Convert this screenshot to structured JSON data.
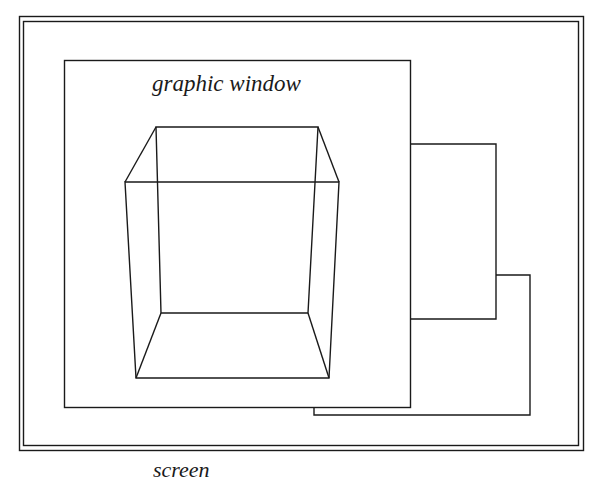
{
  "diagram": {
    "screen_label": "screen",
    "graphic_window_label": "graphic window",
    "stroke_color": "#1a1a1a",
    "background_color": "#ffffff"
  },
  "elements": {
    "screen": {
      "outer": [
        19,
        16,
        583,
        450
      ],
      "inner": [
        23,
        21,
        579,
        446
      ]
    },
    "graphic_window": [
      64,
      60,
      410,
      407
    ],
    "window_2": [
      410,
      144,
      496,
      319
    ],
    "window_3": [
      314,
      275,
      530,
      415
    ],
    "cube": {
      "back_top_left": [
        156,
        127
      ],
      "back_top_right": [
        318,
        127
      ],
      "front_top_left": [
        125,
        182
      ],
      "front_top_right": [
        339,
        182
      ],
      "back_bottom_left": [
        161,
        313
      ],
      "back_bottom_right": [
        308,
        313
      ],
      "front_bottom_left": [
        136,
        378
      ],
      "front_bottom_right": [
        329,
        378
      ]
    }
  }
}
